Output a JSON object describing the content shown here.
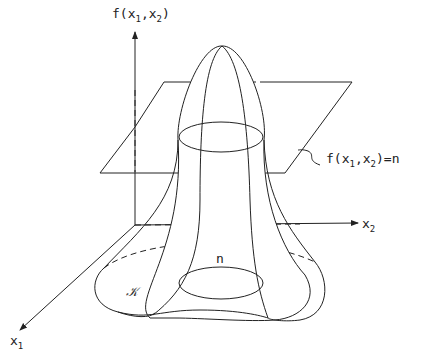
{
  "diagram": {
    "axes": {
      "vertical": {
        "label_main": "f(x",
        "label_sub1": "1",
        "label_mid": ",x",
        "label_sub2": "2",
        "label_end": ")"
      },
      "x2": {
        "label_main": "x",
        "label_sub": "2"
      },
      "x1": {
        "label_main": "x",
        "label_sub": "1"
      }
    },
    "plane_label": {
      "main": "f(x",
      "sub1": "1",
      "mid": ",x",
      "sub2": "2",
      "end": ")=n"
    },
    "level_set_label": "n",
    "domain_label": "𝒦",
    "colors": {
      "stroke": "#222222",
      "background": "#ffffff"
    }
  }
}
